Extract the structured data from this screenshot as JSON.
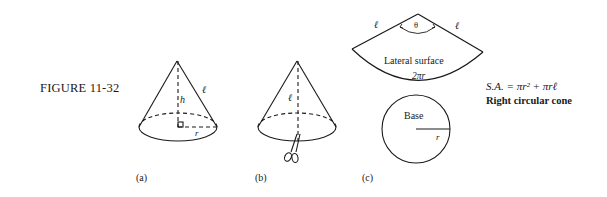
{
  "figure": {
    "title": "FIGURE 11-32",
    "panels": {
      "a": {
        "sublabel": "(a)",
        "labels": {
          "height": "h",
          "slant": "ℓ",
          "radius": "r"
        }
      },
      "b": {
        "sublabel": "(b)",
        "labels": {
          "slant": "ℓ"
        },
        "icon": "scissors-icon"
      },
      "c": {
        "sublabel": "(c)",
        "lateral": {
          "left_edge": "ℓ",
          "right_edge": "ℓ",
          "angle": "θ",
          "name": "Lateral surface",
          "arc_length": "2πr"
        },
        "base": {
          "name": "Base",
          "radius": "r"
        }
      }
    },
    "formula": "S.A. = πr² + πrℓ",
    "caption": "Right circular cone",
    "colors": {
      "ink": "#1a1a1a",
      "background": "#ffffff"
    }
  }
}
